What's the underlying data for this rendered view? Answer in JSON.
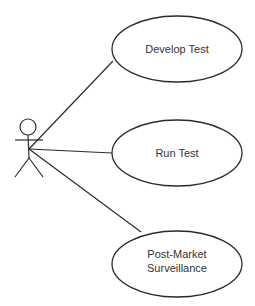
{
  "diagram": {
    "type": "uml-use-case",
    "actor": {
      "label": ""
    },
    "use_cases": [
      {
        "id": "develop-test",
        "lines": [
          "Develop Test"
        ]
      },
      {
        "id": "run-test",
        "lines": [
          "Run Test"
        ]
      },
      {
        "id": "post-market-surveillance",
        "lines": [
          "Post-Market",
          "Surveillance"
        ]
      }
    ],
    "associations": [
      {
        "from": "actor",
        "to": "develop-test"
      },
      {
        "from": "actor",
        "to": "run-test"
      },
      {
        "from": "actor",
        "to": "post-market-surveillance"
      }
    ],
    "colors": {
      "line": "#2b2b2b",
      "text": "#333333",
      "background": "#ffffff"
    }
  }
}
